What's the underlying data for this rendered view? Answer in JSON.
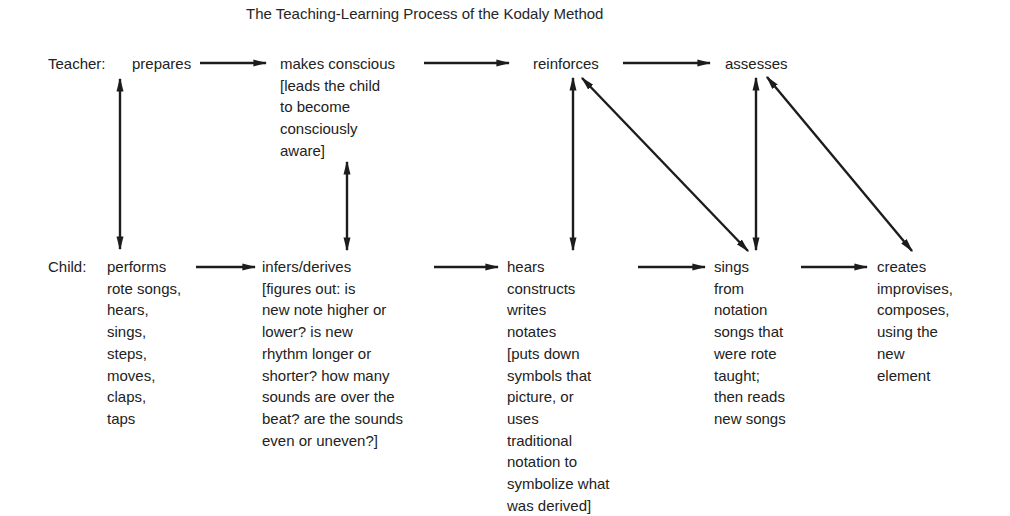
{
  "title": "The Teaching-Learning Process of the Kodaly Method",
  "teacher": {
    "label": "Teacher:",
    "steps": [
      {
        "lines": [
          "prepares"
        ]
      },
      {
        "lines": [
          "makes conscious",
          "[leads the child",
          "to become",
          "consciously",
          "aware]"
        ]
      },
      {
        "lines": [
          "reinforces"
        ]
      },
      {
        "lines": [
          "assesses"
        ]
      }
    ]
  },
  "child": {
    "label": "Child:",
    "steps": [
      {
        "lines": [
          "performs",
          "rote songs,",
          "hears,",
          "sings,",
          "steps,",
          "moves,",
          "claps,",
          "taps"
        ]
      },
      {
        "lines": [
          "infers/derives",
          "[figures out:  is",
          "new note higher or",
          "lower?  is new",
          "rhythm longer or",
          "shorter?  how many",
          "sounds are over the",
          "beat?  are the sounds",
          "even or uneven?]"
        ]
      },
      {
        "lines": [
          "hears",
          "constructs",
          "writes",
          "notates",
          "[puts down",
          "symbols that",
          "picture, or",
          "uses",
          "traditional",
          "notation to",
          "symbolize what",
          "was derived]"
        ]
      },
      {
        "lines": [
          "sings",
          "from",
          "notation",
          "songs that",
          "were rote",
          "taught;",
          "then reads",
          "new songs"
        ]
      },
      {
        "lines": [
          "creates",
          "improvises,",
          "composes,",
          "using the",
          "new",
          "element"
        ]
      }
    ]
  },
  "connections": [
    {
      "from": "prepares",
      "to": "makes conscious",
      "type": "one-way"
    },
    {
      "from": "makes conscious",
      "to": "reinforces",
      "type": "one-way"
    },
    {
      "from": "reinforces",
      "to": "assesses",
      "type": "one-way"
    },
    {
      "from": "performs",
      "to": "infers/derives",
      "type": "one-way"
    },
    {
      "from": "infers/derives",
      "to": "hears/constructs/writes/notates",
      "type": "one-way"
    },
    {
      "from": "hears/constructs/writes/notates",
      "to": "sings from notation",
      "type": "one-way"
    },
    {
      "from": "sings from notation",
      "to": "creates",
      "type": "one-way"
    },
    {
      "from": "prepares",
      "to": "performs",
      "type": "two-way"
    },
    {
      "from": "makes conscious",
      "to": "infers/derives",
      "type": "two-way"
    },
    {
      "from": "reinforces",
      "to": "hears/constructs/writes/notates",
      "type": "two-way"
    },
    {
      "from": "reinforces",
      "to": "sings from notation",
      "type": "two-way"
    },
    {
      "from": "assesses",
      "to": "sings from notation",
      "type": "two-way"
    },
    {
      "from": "assesses",
      "to": "creates",
      "type": "two-way"
    }
  ]
}
